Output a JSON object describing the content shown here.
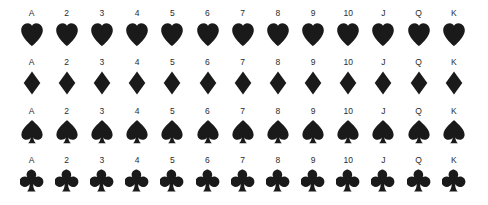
{
  "figure": {
    "background_color": "#ffffff",
    "glyph_color": "#1a1a1a",
    "label_color": "#2b2b2b"
  },
  "ranks": [
    "A",
    "2",
    "3",
    "4",
    "5",
    "6",
    "7",
    "8",
    "9",
    "10",
    "J",
    "Q",
    "K"
  ],
  "rows": [
    {
      "suit": "hearts",
      "icon_name": "heart-icon",
      "symbol": "♥",
      "color": "#1a1a1a",
      "labels": [
        "A",
        "2",
        "3",
        "4",
        "5",
        "6",
        "7",
        "8",
        "9",
        "10",
        "J",
        "Q",
        "K"
      ]
    },
    {
      "suit": "diamonds",
      "icon_name": "diamond-icon",
      "symbol": "♦",
      "color": "#1a1a1a",
      "labels": [
        "A",
        "2",
        "3",
        "4",
        "5",
        "6",
        "7",
        "8",
        "9",
        "10",
        "J",
        "Q",
        "K"
      ]
    },
    {
      "suit": "spades",
      "icon_name": "spade-icon",
      "symbol": "♠",
      "color": "#1a1a1a",
      "labels": [
        "A",
        "2",
        "3",
        "4",
        "5",
        "6",
        "7",
        "8",
        "9",
        "10",
        "J",
        "Q",
        "K"
      ]
    },
    {
      "suit": "clubs",
      "icon_name": "club-icon",
      "symbol": "♣",
      "color": "#1a1a1a",
      "labels": [
        "A",
        "2",
        "3",
        "4",
        "5",
        "6",
        "7",
        "8",
        "9",
        "10",
        "J",
        "Q",
        "K"
      ]
    }
  ]
}
